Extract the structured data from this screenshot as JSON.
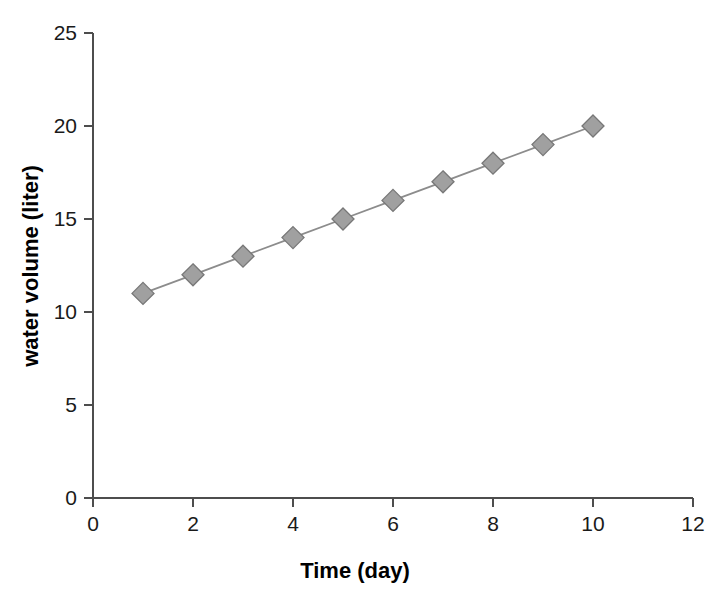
{
  "chart_data": {
    "type": "line",
    "title": "",
    "xlabel": "Time (day)",
    "ylabel": "water volume (liter)",
    "x": [
      1,
      2,
      3,
      4,
      5,
      6,
      7,
      8,
      9,
      10
    ],
    "values": [
      11,
      12,
      13,
      14,
      15,
      16,
      17,
      18,
      19,
      20
    ],
    "series": [
      {
        "name": "water volume",
        "x": [
          1,
          2,
          3,
          4,
          5,
          6,
          7,
          8,
          9,
          10
        ],
        "values": [
          11,
          12,
          13,
          14,
          15,
          16,
          17,
          18,
          19,
          20
        ]
      }
    ],
    "xlim": [
      0,
      12
    ],
    "ylim": [
      0,
      25
    ],
    "xticks": [
      0,
      2,
      4,
      6,
      8,
      10,
      12
    ],
    "yticks": [
      0,
      5,
      10,
      15,
      20,
      25
    ],
    "xtick_labels": [
      "0",
      "2",
      "4",
      "6",
      "8",
      "10",
      "12"
    ],
    "ytick_labels": [
      "0",
      "5",
      "10",
      "15",
      "20",
      "25"
    ],
    "grid": false,
    "legend": false,
    "legend_position": "none",
    "marker": "diamond",
    "marker_color": "#a0a0a0",
    "marker_edge_color": "#777777",
    "line_color": "#8c8c8c",
    "axis_color": "#4d4d4d",
    "background_color": "#ffffff",
    "annotations": []
  }
}
